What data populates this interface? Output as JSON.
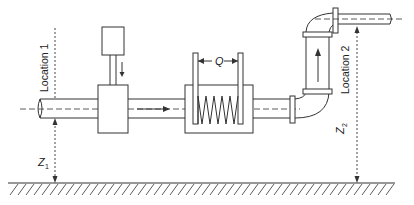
{
  "diagram": {
    "type": "pumping-system-schematic",
    "labels": {
      "location_1": "Location 1",
      "location_2": "Location 2",
      "z1_base": "Z",
      "z1_sub": "1",
      "z2_base": "Z",
      "z2_sub": "2",
      "flow_rate": "Q"
    },
    "components": [
      "inlet-pipe",
      "motor",
      "pump-housing",
      "flow-meter-spring",
      "elbow-bend-lower",
      "vertical-pipe",
      "elbow-bend-upper",
      "outlet-pipe",
      "ground-datum"
    ],
    "colors": {
      "line": "#333333",
      "text": "#222222",
      "background": "#ffffff"
    }
  }
}
